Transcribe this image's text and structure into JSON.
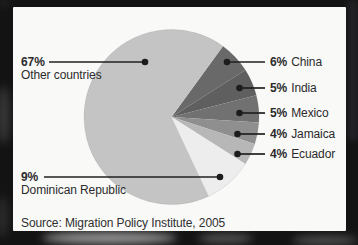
{
  "frame": {
    "color": "#131313"
  },
  "panel": {
    "bg": "#f9f9f8"
  },
  "chart_data": {
    "type": "pie",
    "unit": "percent",
    "start_angle_deg": 36,
    "clockwise": true,
    "legend_position": "callout labels with leader lines and dots",
    "slices": [
      {
        "label": "China",
        "value": 6,
        "pct_label": "6%",
        "color": "#696969"
      },
      {
        "label": "India",
        "value": 5,
        "pct_label": "5%",
        "color": "#5f5f5f"
      },
      {
        "label": "Mexico",
        "value": 5,
        "pct_label": "5%",
        "color": "#717171"
      },
      {
        "label": "Jamaica",
        "value": 4,
        "pct_label": "4%",
        "color": "#8f8f8f"
      },
      {
        "label": "Ecuador",
        "value": 4,
        "pct_label": "4%",
        "color": "#b7b7b7"
      },
      {
        "label": "Dominican Republic",
        "value": 9,
        "pct_label": "9%",
        "color": "#ededed"
      },
      {
        "label": "Other countries",
        "value": 67,
        "pct_label": "67%",
        "color": "#c4c4c4"
      }
    ],
    "source": "Source: Migration Policy Institute, 2005"
  }
}
